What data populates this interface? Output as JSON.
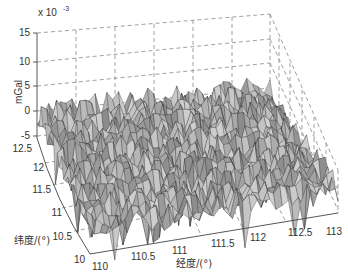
{
  "chart_data": {
    "type": "surface3d",
    "title": "",
    "zlabel": "mGal",
    "z_exponent_label": "x 10^-3",
    "xlabel": "经度/(°)",
    "ylabel": "纬度/(°)",
    "x_ticks": [
      "110",
      "110.5",
      "111",
      "111.5",
      "112",
      "112.5",
      "113"
    ],
    "y_ticks": [
      "10",
      "10.5",
      "11",
      "11.5",
      "12",
      "12.5"
    ],
    "z_ticks": [
      "-5",
      "0",
      "5",
      "10",
      "15"
    ],
    "xlim": [
      110,
      113
    ],
    "ylim": [
      10,
      12.5
    ],
    "zlim": [
      -5,
      15
    ],
    "z_unit_scale": 0.001,
    "grid": true,
    "grid_style": "dashed",
    "surface_color": "#a8a8a8",
    "edge_color": "#333333"
  },
  "labels": {
    "exp_prefix": "x 10",
    "exp_power": "-3",
    "zlabel": "mGal",
    "xlabel": "经度/(°)",
    "ylabel": "纬度/(°)"
  }
}
